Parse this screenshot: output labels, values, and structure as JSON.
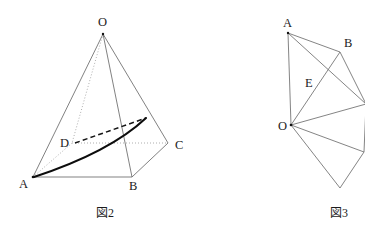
{
  "page": {
    "background_color": "#ffffff",
    "ink_color": "#1a1a1a",
    "width": 365,
    "height": 232
  },
  "figure_left": {
    "caption": "図2",
    "description": "square pyramid O-ABCD with a bold path from A over edge to a point on OC",
    "vertices": [
      {
        "id": "O",
        "label": "O",
        "x": 103,
        "y": 34,
        "label_x": 98,
        "label_y": 26
      },
      {
        "id": "A",
        "label": "A",
        "x": 33,
        "y": 177,
        "label_x": 19,
        "label_y": 188
      },
      {
        "id": "B",
        "label": "B",
        "x": 132,
        "y": 177,
        "label_x": 129,
        "label_y": 190
      },
      {
        "id": "C",
        "label": "C",
        "x": 168,
        "y": 143,
        "label_x": 175,
        "label_y": 149
      },
      {
        "id": "D",
        "label": "D",
        "x": 72,
        "y": 143,
        "label_x": 60,
        "label_y": 147
      }
    ],
    "caption_x": 96,
    "caption_y": 217,
    "mark_point": {
      "id": "P",
      "x": 146,
      "y": 118
    }
  },
  "figure_right": {
    "caption": "図3",
    "description": "net (development) of the pyramid with labelled points A, B, E, O",
    "vertices": [
      {
        "id": "A",
        "label": "A",
        "x": 288,
        "y": 33,
        "label_x": 283,
        "label_y": 27
      },
      {
        "id": "B",
        "label": "B",
        "x": 340,
        "y": 52,
        "label_x": 344,
        "label_y": 47
      },
      {
        "id": "E",
        "label": "E",
        "x": 320,
        "y": 90,
        "label_x": 305,
        "label_y": 87
      },
      {
        "id": "O",
        "label": "O",
        "x": 291,
        "y": 125,
        "label_x": 278,
        "label_y": 130
      },
      {
        "id": "R1",
        "label": "",
        "x": 366,
        "y": 104,
        "label_x": 0,
        "label_y": 0
      },
      {
        "id": "R2",
        "label": "",
        "x": 364,
        "y": 152,
        "label_x": 0,
        "label_y": 0
      },
      {
        "id": "R3",
        "label": "",
        "x": 340,
        "y": 188,
        "label_x": 0,
        "label_y": 0
      }
    ],
    "caption_x": 330,
    "caption_y": 217
  }
}
